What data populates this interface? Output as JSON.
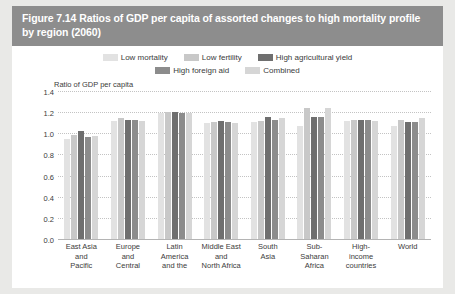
{
  "figure": {
    "title": "Figure 7.14 Ratios of GDP per capita of assorted changes to high mortality profile by region (2060)"
  },
  "colors": {
    "banner_bg": "#8d8d8d",
    "banner_text": "#ffffff",
    "page_bg": "#e9e9e7",
    "panel_bg": "#ffffff",
    "grid": "#c3c3c3",
    "axis": "#b4b4b4",
    "text": "#3b3b3b",
    "series": [
      "#e2e2e2",
      "#c8c8c8",
      "#6f6f6f",
      "#8c8c8c",
      "#d6d6d6"
    ]
  },
  "chart_data": {
    "type": "bar",
    "title": "Figure 7.14 Ratios of GDP per capita of assorted changes to high mortality profile by region (2060)",
    "xlabel": "",
    "ylabel": "Ratio of GDP per capita",
    "ylim": [
      0.0,
      1.4
    ],
    "yticks": [
      "0.0",
      "0.2",
      "0.4",
      "0.6",
      "0.8",
      "1.0",
      "1.2",
      "1.4"
    ],
    "ytick_values": [
      0.0,
      0.2,
      0.4,
      0.6,
      0.8,
      1.0,
      1.2,
      1.4
    ],
    "grid": true,
    "legend_position": "top",
    "categories": [
      "East Asia and Pacific",
      "Europe and Central",
      "Latin America and the",
      "Middle East and North Africa",
      "South Asia",
      "Sub-Saharan Africa",
      "High-income countries",
      "World"
    ],
    "category_lines": [
      [
        "East Asia",
        "and",
        "Pacific"
      ],
      [
        "Europe",
        "and",
        "Central"
      ],
      [
        "Latin",
        "America",
        "and the"
      ],
      [
        "Middle East",
        "and",
        "North Africa"
      ],
      [
        "South",
        "Asia"
      ],
      [
        "Sub-",
        "Saharan",
        "Africa"
      ],
      [
        "High-",
        "income",
        "countries"
      ],
      [
        "World"
      ]
    ],
    "series": [
      {
        "name": "Low mortality",
        "values": [
          0.96,
          1.13,
          1.2,
          1.11,
          1.12,
          1.08,
          1.13,
          1.08
        ]
      },
      {
        "name": "Low fertility",
        "values": [
          0.99,
          1.15,
          1.21,
          1.12,
          1.13,
          1.25,
          1.14,
          1.14
        ]
      },
      {
        "name": "High agricultural yield",
        "values": [
          1.03,
          1.14,
          1.21,
          1.13,
          1.16,
          1.16,
          1.14,
          1.12
        ]
      },
      {
        "name": "High foreign aid",
        "values": [
          0.97,
          1.14,
          1.2,
          1.12,
          1.14,
          1.16,
          1.14,
          1.12
        ]
      },
      {
        "name": "Combined",
        "values": [
          0.98,
          1.13,
          1.2,
          1.11,
          1.15,
          1.25,
          1.13,
          1.15
        ]
      }
    ]
  }
}
